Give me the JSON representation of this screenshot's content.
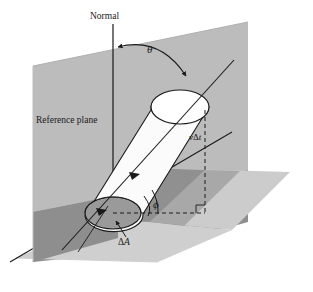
{
  "figure": {
    "background_color": "#ffffff",
    "ink_color": "#1a1a1a"
  },
  "labels": {
    "normal": "Normal",
    "reference_plane": "Reference plane",
    "theta": "θ",
    "phi": "ϕ",
    "v_delta_t_symbol": "v",
    "v_delta_t_delta": "Δ",
    "v_delta_t_time": "t",
    "delta_a_delta": "Δ",
    "delta_a_area": "A"
  },
  "colors": {
    "vertical_plane_upper": "#bcbcbc",
    "vertical_plane_lower": "#8e8e8e",
    "horizontal_plane": "#cccccc",
    "horizontal_plane_shadow": "#6f6f6f",
    "cylinder_body": "#fbfbfb",
    "cylinder_top_face": "#ffffff",
    "base_ellipse_fill": "#9a9a9a",
    "stroke": "#1a1a1a"
  },
  "geometry": {
    "normal_line": {
      "x": 113,
      "y_top": 24,
      "y_bottom": 216
    },
    "theta_arc": {
      "from_x": 116,
      "from_y": 47,
      "to_x": 192,
      "to_y": 82
    },
    "base_ellipse": {
      "cx": 113,
      "cy": 213,
      "rx": 28,
      "ry": 16
    },
    "top_ellipse": {
      "cx": 180,
      "cy": 107,
      "rx": 29,
      "ry": 17
    },
    "vertical_plane_points": "33,66 248,22 248,222 33,262",
    "horizontal_plane_points": "16,258 148,168 290,172 158,262",
    "flow_axis": {
      "x1": 60,
      "y1": 252,
      "x2": 232,
      "y2": 62
    },
    "dashed_vertical": {
      "x": 205,
      "y_top": 110,
      "y_bottom": 213
    },
    "dashed_horizontal": {
      "y": 213,
      "x_left": 113,
      "x_right": 205
    }
  },
  "elements": [
    {
      "name": "vertical-reference-plane",
      "kind": "plane"
    },
    {
      "name": "horizontal-plane",
      "kind": "plane"
    },
    {
      "name": "cylinder",
      "kind": "solid"
    },
    {
      "name": "normal-line",
      "kind": "line"
    },
    {
      "name": "theta-arc",
      "kind": "arc"
    },
    {
      "name": "flow-axis-arrow",
      "kind": "arrow"
    },
    {
      "name": "phi-arc",
      "kind": "arc"
    },
    {
      "name": "delta-a-leader",
      "kind": "leader"
    }
  ]
}
